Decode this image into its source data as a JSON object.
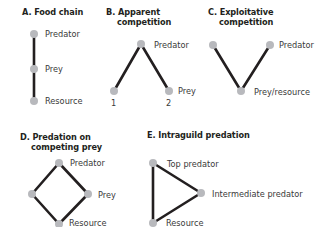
{
  "colors": {
    "edge": "#231f20",
    "node": "#b8b9bd",
    "text": "#3a3a3a"
  },
  "panels": {
    "A": {
      "title": "A. Food chain",
      "labels": {
        "top": "Predator",
        "mid": "Prey",
        "bottom": "Resource"
      }
    },
    "B": {
      "title_line1": "B. Apparent",
      "title_line2": "competition",
      "labels": {
        "top": "Predator",
        "right": "Prey",
        "n1": "1",
        "n2": "2"
      }
    },
    "C": {
      "title_line1": "C. Exploitative",
      "title_line2": "competition",
      "labels": {
        "right": "Predator",
        "bottom": "Prey/resource"
      }
    },
    "D": {
      "title_line1": "D. Predation on",
      "title_line2": "competing prey",
      "labels": {
        "top": "Predator",
        "right": "Prey",
        "bottom": "Resource"
      }
    },
    "E": {
      "title": "E. Intraguild predation",
      "labels": {
        "top": "Top predator",
        "mid": "Intermediate predator",
        "bottom": "Resource"
      }
    }
  }
}
